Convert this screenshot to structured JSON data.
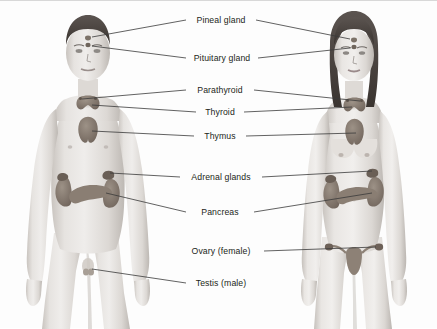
{
  "figure": {
    "background_color": "#fdfdfd",
    "text_color": "#231f20",
    "leader_line_color": "#3a3a3a",
    "skin_light": "#eceae8",
    "skin_mid": "#d6d2ce",
    "skin_shadow": "#b6b1ac",
    "hair_color": "#4a4440",
    "organ_color": "#8d8176",
    "organ_dark": "#6d6158"
  },
  "subjects": [
    {
      "name": "male-figure",
      "side": "left",
      "center_x": 88,
      "description": "Adult male anatomical figure, front view, short dark hair"
    },
    {
      "name": "female-figure",
      "side": "right",
      "center_x": 352,
      "description": "Adult female anatomical figure, front view, long dark hair"
    }
  ],
  "labels": [
    {
      "id": "pineal",
      "text": "Pineal gland",
      "x": 221,
      "y": 19,
      "leaders": [
        "left",
        "right"
      ]
    },
    {
      "id": "pituitary",
      "text": "Pituitary gland",
      "x": 221,
      "y": 57,
      "leaders": [
        "left",
        "right"
      ]
    },
    {
      "id": "parathyroid",
      "text": "Parathyroid",
      "x": 221,
      "y": 89,
      "leaders": [
        "left",
        "right"
      ]
    },
    {
      "id": "thyroid",
      "text": "Thyroid",
      "x": 221,
      "y": 111,
      "leaders": [
        "left",
        "right"
      ]
    },
    {
      "id": "thymus",
      "text": "Thymus",
      "x": 221,
      "y": 135,
      "leaders": [
        "left",
        "right"
      ]
    },
    {
      "id": "adrenal",
      "text": "Adrenal glands",
      "x": 221,
      "y": 176,
      "leaders": [
        "left",
        "right"
      ]
    },
    {
      "id": "pancreas",
      "text": "Pancreas",
      "x": 221,
      "y": 211,
      "leaders": [
        "left",
        "right"
      ]
    },
    {
      "id": "ovary",
      "text": "Ovary (female)",
      "x": 221,
      "y": 250,
      "leaders": [
        "right"
      ]
    },
    {
      "id": "testis",
      "text": "Testis (male)",
      "x": 221,
      "y": 282,
      "leaders": [
        "left"
      ]
    }
  ],
  "organs": [
    {
      "name": "pineal-gland",
      "figures": [
        "male",
        "female"
      ]
    },
    {
      "name": "pituitary-gland",
      "figures": [
        "male",
        "female"
      ]
    },
    {
      "name": "parathyroid-gland",
      "figures": [
        "male",
        "female"
      ]
    },
    {
      "name": "thyroid-gland",
      "figures": [
        "male",
        "female"
      ]
    },
    {
      "name": "thymus-gland",
      "figures": [
        "male",
        "female"
      ]
    },
    {
      "name": "adrenal-gland",
      "figures": [
        "male",
        "female"
      ]
    },
    {
      "name": "kidney",
      "figures": [
        "male",
        "female"
      ]
    },
    {
      "name": "pancreas",
      "figures": [
        "male",
        "female"
      ]
    },
    {
      "name": "ovary",
      "figures": [
        "female"
      ]
    },
    {
      "name": "uterus",
      "figures": [
        "female"
      ]
    },
    {
      "name": "testis",
      "figures": [
        "male"
      ]
    }
  ]
}
